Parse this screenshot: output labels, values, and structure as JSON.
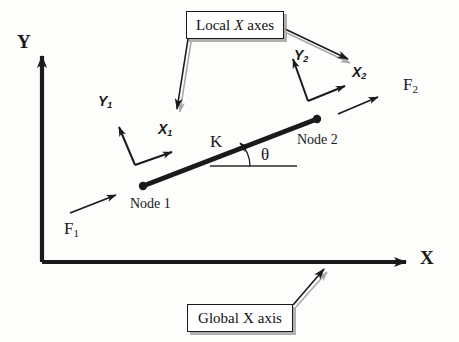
{
  "diagram": {
    "background_color": "#fdfdfc",
    "ink_color": "#1a1a1a",
    "shadow_color": "#969696",
    "global_axes": {
      "y_label": "Y",
      "x_label": "X",
      "origin": {
        "x": 42,
        "y": 262
      },
      "y_tip": {
        "x": 42,
        "y": 50
      },
      "x_tip": {
        "x": 414,
        "y": 262
      }
    },
    "element": {
      "stiffness_label": "K",
      "angle_label": "θ",
      "node1_label": "Node 1",
      "node2_label": "Node 2",
      "node1_point": {
        "x": 143,
        "y": 186
      },
      "node2_point": {
        "x": 317,
        "y": 119
      }
    },
    "local_axes_node1": {
      "x_label": "X",
      "x_subscript": "1",
      "y_label": "Y",
      "y_subscript": "1"
    },
    "local_axes_node2": {
      "x_label": "X",
      "x_subscript": "2",
      "y_label": "Y",
      "y_subscript": "2"
    },
    "forces": [
      {
        "label": "F",
        "subscript": "1"
      },
      {
        "label": "F",
        "subscript": "2"
      }
    ],
    "callouts": {
      "local": {
        "prefix": "Local",
        "italic": "X",
        "suffix": "axes"
      },
      "global": {
        "prefix": "Global",
        "italic": "X",
        "suffix": "axis"
      }
    }
  }
}
